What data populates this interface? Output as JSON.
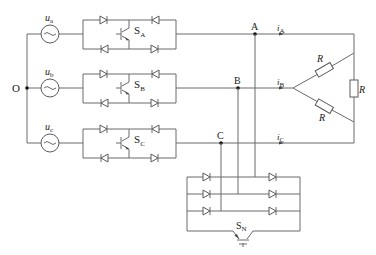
{
  "diagram": {
    "ground_node": {
      "label": "O"
    },
    "sources": [
      {
        "id": "ua",
        "label": "u",
        "subscript": "a"
      },
      {
        "id": "ub",
        "label": "u",
        "subscript": "b"
      },
      {
        "id": "uc",
        "label": "u",
        "subscript": "c"
      }
    ],
    "switches": [
      {
        "id": "SA",
        "label": "S",
        "subscript": "A"
      },
      {
        "id": "SB",
        "label": "S",
        "subscript": "B"
      },
      {
        "id": "SC",
        "label": "S",
        "subscript": "C"
      },
      {
        "id": "SN",
        "label": "S",
        "subscript": "N"
      }
    ],
    "nodes": [
      {
        "id": "A",
        "label": "A"
      },
      {
        "id": "B",
        "label": "B"
      },
      {
        "id": "C",
        "label": "C"
      }
    ],
    "currents": [
      {
        "id": "iA",
        "label": "i",
        "subscript": "A"
      },
      {
        "id": "iB",
        "label": "i",
        "subscript": "B"
      },
      {
        "id": "iC",
        "label": "i",
        "subscript": "C"
      }
    ],
    "resistors": [
      {
        "id": "R_AB",
        "label": "R"
      },
      {
        "id": "R_BC",
        "label": "R"
      },
      {
        "id": "R_CA",
        "label": "R"
      }
    ],
    "colors": {
      "wire": "#6a6a6a",
      "component": "#5a5a5a",
      "node": "#111111",
      "text": "#222222"
    }
  }
}
